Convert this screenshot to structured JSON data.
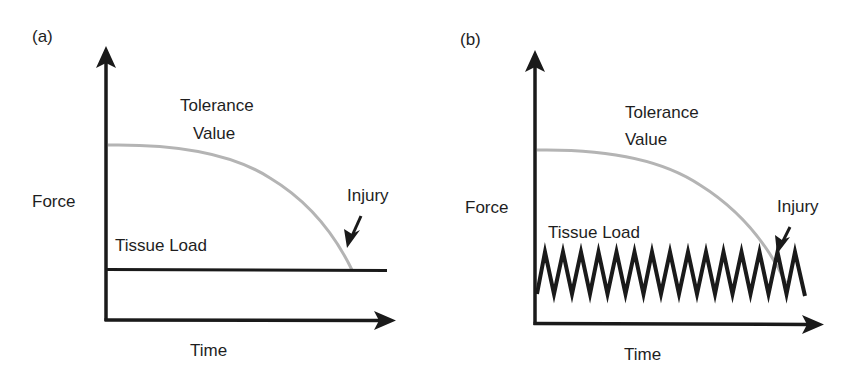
{
  "colors": {
    "axis": "#1a1a1a",
    "tissue_load": "#1a1a1a",
    "tolerance_curve": "#b4b4b4",
    "text": "#1e1e1e",
    "background": "#ffffff"
  },
  "panels": [
    {
      "id": "a",
      "label": "(a)",
      "y_axis_label": "Force",
      "x_axis_label": "Time",
      "tolerance_label_line1": "Tolerance",
      "tolerance_label_line2": "Value",
      "tissue_load_label": "Tissue Load",
      "injury_label": "Injury",
      "tissue_load_shape": "constant"
    },
    {
      "id": "b",
      "label": "(b)",
      "y_axis_label": "Force",
      "x_axis_label": "Time",
      "tolerance_label_line1": "Tolerance",
      "tolerance_label_line2": "Value",
      "tissue_load_label": "Tissue Load",
      "injury_label": "Injury",
      "tissue_load_shape": "cyclic",
      "cycles": 15
    }
  ]
}
